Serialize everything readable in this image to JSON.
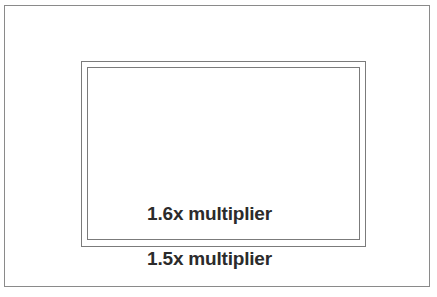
{
  "diagram": {
    "background_color": "#ffffff",
    "line_color": "#8a8a8a",
    "text_color": "#2b2b2b",
    "frames": [
      {
        "name": "full-frame",
        "label": "",
        "order": 1
      },
      {
        "name": "aps-c-1-5x",
        "label": "1.5x multiplier",
        "order": 2
      },
      {
        "name": "aps-c-1-6x",
        "label": "1.6x multiplier",
        "order": 3
      }
    ]
  },
  "labels": {
    "inner": "1.6x multiplier",
    "middle": "1.5x multiplier"
  }
}
